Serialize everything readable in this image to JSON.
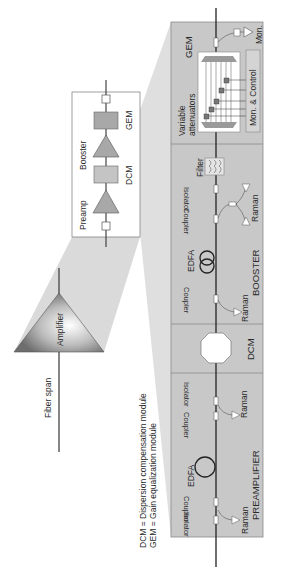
{
  "colors": {
    "panel": "#c9c9c9",
    "panel_border": "#8a8a8a",
    "funnel": "#d4d4d4",
    "fiber": "#333333",
    "component_fill": "#a9a9a9",
    "box_fill": "#ffffff"
  },
  "overview": {
    "fiber_span_label": "Fiber span",
    "amplifier_label": "Amplifier"
  },
  "zoom1": {
    "preamp_label": "Preamp",
    "booster_label": "Booster",
    "dcm_label": "DCM",
    "gem_label": "GEM"
  },
  "legend": {
    "dcm_def": "DCM = Dispersion compensation module",
    "gem_def": "GEM = Gain equalization module"
  },
  "detail": {
    "gem": {
      "title": "GEM",
      "variable_attenuators": [
        "Variable",
        "attenuators"
      ],
      "mon_control": "Mon. & Control",
      "mon": "Mon."
    },
    "booster": {
      "title": "BOOSTER",
      "filter": "Filter",
      "isolator": "Isolator",
      "raman_top": "Raman",
      "coupler_top": "Coupler",
      "edfa": "EDFA",
      "coupler_bottom": "Coupler",
      "raman_bottom": "Raman"
    },
    "dcm": {
      "title": "DCM"
    },
    "preamplifier": {
      "title": "PREAMPLIFIER",
      "isolator_top": "Isolator",
      "raman_top": "Raman",
      "coupler_top": "Coupler",
      "edfa": "EDFA",
      "coupler_bottom": "Coupler",
      "isolator_bottom": "Isolator",
      "raman_bottom": "Raman"
    }
  }
}
